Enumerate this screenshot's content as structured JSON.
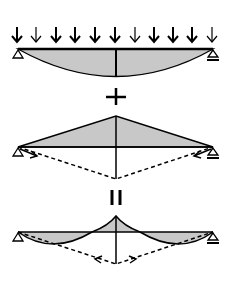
{
  "diagram": {
    "colors": {
      "line": "#000000",
      "fill": "#c8c8c8",
      "background": "#ffffff"
    },
    "panels": [
      {
        "id": "uniform-load",
        "description": "Simply supported beam under uniform distributed load with parabolic moment diagram",
        "arrow_count": 11
      },
      {
        "id": "prestress",
        "description": "Triangular moment diagram from cable/strut with dashed inclined members"
      },
      {
        "id": "result",
        "description": "Combined moment diagram with peak at mid-span"
      }
    ],
    "operators": {
      "plus": "+",
      "equals": "="
    }
  }
}
